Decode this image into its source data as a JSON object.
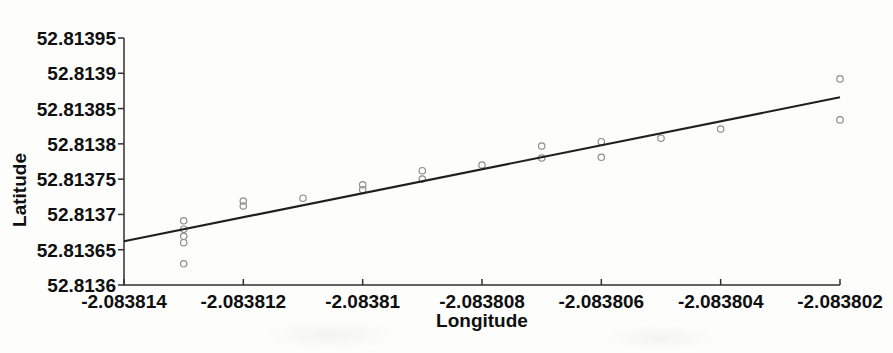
{
  "chart_data": {
    "type": "scatter",
    "title": "",
    "xlabel": "Longitude",
    "ylabel": "Latitude",
    "xlim": [
      -2.083814,
      -2.083802
    ],
    "ylim": [
      52.8136,
      52.81395
    ],
    "grid": false,
    "legend": "none",
    "x_ticks": [
      {
        "value": -2.083814,
        "label": "-2.083814"
      },
      {
        "value": -2.083812,
        "label": "-2.083812"
      },
      {
        "value": -2.08381,
        "label": "-2.08381"
      },
      {
        "value": -2.083808,
        "label": "-2.083808"
      },
      {
        "value": -2.083806,
        "label": "-2.083806"
      },
      {
        "value": -2.083804,
        "label": "-2.083804"
      },
      {
        "value": -2.083802,
        "label": "-2.083802"
      }
    ],
    "y_ticks": [
      {
        "value": 52.8136,
        "label": "52.8136"
      },
      {
        "value": 52.81365,
        "label": "52.81365"
      },
      {
        "value": 52.8137,
        "label": "52.8137"
      },
      {
        "value": 52.81375,
        "label": "52.81375"
      },
      {
        "value": 52.8138,
        "label": "52.8138"
      },
      {
        "value": 52.81385,
        "label": "52.81385"
      },
      {
        "value": 52.8139,
        "label": "52.8139"
      },
      {
        "value": 52.81395,
        "label": "52.81395"
      }
    ],
    "points": [
      [
        -2.083813,
        52.813691
      ],
      [
        -2.083813,
        52.813679
      ],
      [
        -2.083813,
        52.813669
      ],
      [
        -2.083813,
        52.81366
      ],
      [
        -2.083813,
        52.81363
      ],
      [
        -2.083812,
        52.813719
      ],
      [
        -2.083812,
        52.813712
      ],
      [
        -2.083811,
        52.813723
      ],
      [
        -2.08381,
        52.813742
      ],
      [
        -2.08381,
        52.813735
      ],
      [
        -2.083809,
        52.813762
      ],
      [
        -2.083809,
        52.81375
      ],
      [
        -2.083808,
        52.81377
      ],
      [
        -2.083807,
        52.813797
      ],
      [
        -2.083807,
        52.81378
      ],
      [
        -2.083806,
        52.813803
      ],
      [
        -2.083806,
        52.813781
      ],
      [
        -2.083805,
        52.813808
      ],
      [
        -2.083804,
        52.813821
      ],
      [
        -2.083802,
        52.813892
      ],
      [
        -2.083802,
        52.813834
      ]
    ],
    "fit_line": {
      "x1": -2.083814,
      "y1": 52.813662,
      "x2": -2.083802,
      "y2": 52.813866
    },
    "styles": {
      "point_color": "#8d8d8d",
      "fit_line_color": "#1f1f1f",
      "axis_color": "#303030",
      "text_color": "#0f0f0f",
      "background": "#fdfdfc"
    }
  }
}
